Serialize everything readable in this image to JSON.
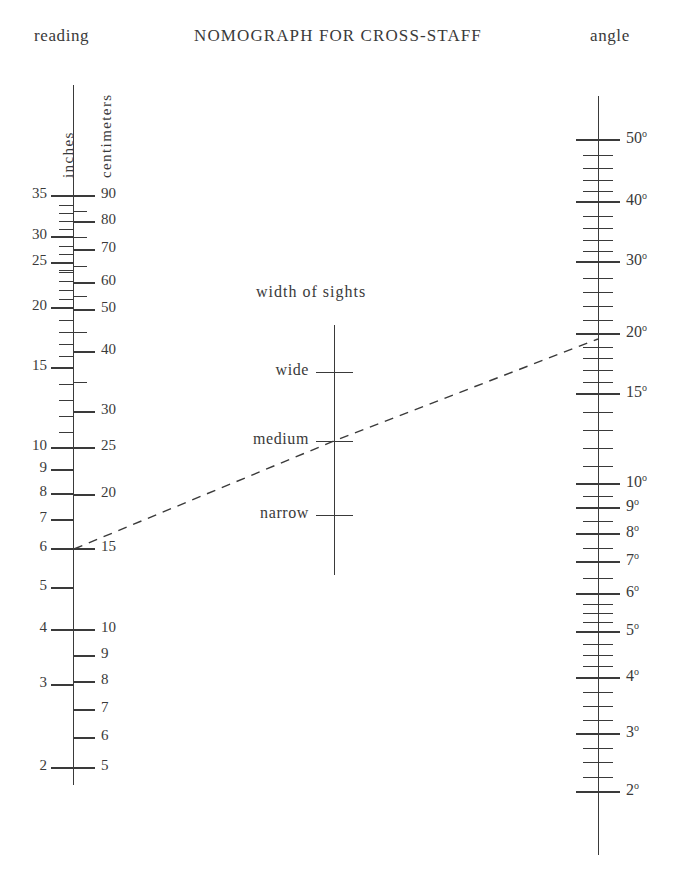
{
  "header": {
    "title": "NOMOGRAPH FOR CROSS-STAFF",
    "left_label": "reading",
    "right_label": "angle"
  },
  "left_scale": {
    "unit_left": "inches",
    "unit_right": "centimeters",
    "inch_labels": [
      "35",
      "30",
      "25",
      "20",
      "15",
      "10",
      "9",
      "8",
      "7",
      "6",
      "5",
      "4",
      "3",
      "2"
    ],
    "cm_labels": [
      "90",
      "80",
      "70",
      "60",
      "50",
      "40",
      "30",
      "25",
      "20",
      "15",
      "10",
      "9",
      "8",
      "7",
      "6",
      "5"
    ]
  },
  "middle_scale": {
    "title": "width of sights",
    "labels": [
      "wide",
      "medium",
      "narrow"
    ]
  },
  "right_scale": {
    "unit": "angle",
    "labels": [
      "50°",
      "40°",
      "30°",
      "20°",
      "15°",
      "10°",
      "9°",
      "8°",
      "7°",
      "6°",
      "5°",
      "4°",
      "3°",
      "2°"
    ]
  },
  "index_line": {
    "style": "dashed",
    "from_reading_inches": "6",
    "from_reading_cm": "15",
    "through_width": "medium",
    "to_angle": "19°"
  },
  "colors": {
    "ink": "#3a3a3a",
    "paper": "#ffffff"
  },
  "chart_data": {
    "type": "line",
    "title": "NOMOGRAPH FOR CROSS-STAFF",
    "subtitle": "",
    "xlabel": "",
    "ylabel": "",
    "grid": false,
    "legend": "none",
    "axes": [
      {
        "name": "reading",
        "position": "left",
        "x_px": 73,
        "y_top_px": 85,
        "y_bottom_px": 785,
        "units": [
          "inches",
          "centimeters"
        ],
        "inch_ticks": [
          {
            "value": 35,
            "y": 196,
            "label": "35"
          },
          {
            "value": 34,
            "y": 205,
            "label": ""
          },
          {
            "value": 33,
            "y": 213,
            "label": ""
          },
          {
            "value": 32,
            "y": 221,
            "label": ""
          },
          {
            "value": 31,
            "y": 229,
            "label": ""
          },
          {
            "value": 30,
            "y": 237,
            "label": "30"
          },
          {
            "value": 29,
            "y": 246,
            "label": ""
          },
          {
            "value": 28,
            "y": 254,
            "label": ""
          },
          {
            "value": 27,
            "y": 262,
            "label": ""
          },
          {
            "value": 26,
            "y": 270,
            "label": ""
          },
          {
            "value": 25,
            "y": 263,
            "label": "25"
          },
          {
            "value": 24,
            "y": 272,
            "label": ""
          },
          {
            "value": 23,
            "y": 281,
            "label": ""
          },
          {
            "value": 22,
            "y": 290,
            "label": ""
          },
          {
            "value": 21,
            "y": 299,
            "label": ""
          },
          {
            "value": 20,
            "y": 308,
            "label": "20"
          },
          {
            "value": 19,
            "y": 320,
            "label": ""
          },
          {
            "value": 18,
            "y": 332,
            "label": ""
          },
          {
            "value": 17,
            "y": 344,
            "label": ""
          },
          {
            "value": 16,
            "y": 356,
            "label": ""
          },
          {
            "value": 15,
            "y": 368,
            "label": "15"
          },
          {
            "value": 14,
            "y": 384,
            "label": ""
          },
          {
            "value": 13,
            "y": 400,
            "label": ""
          },
          {
            "value": 12,
            "y": 416,
            "label": ""
          },
          {
            "value": 11,
            "y": 432,
            "label": ""
          },
          {
            "value": 10,
            "y": 448,
            "label": "10"
          },
          {
            "value": 9,
            "y": 470,
            "label": "9"
          },
          {
            "value": 8,
            "y": 494,
            "label": "8"
          },
          {
            "value": 7,
            "y": 520,
            "label": "7"
          },
          {
            "value": 6,
            "y": 549,
            "label": "6"
          },
          {
            "value": 5,
            "y": 588,
            "label": "5"
          },
          {
            "value": 4,
            "y": 630,
            "label": "4"
          },
          {
            "value": 3,
            "y": 685,
            "label": "3"
          },
          {
            "value": 2,
            "y": 768,
            "label": "2"
          }
        ],
        "cm_ticks": [
          {
            "value": 90,
            "y": 196,
            "label": "90"
          },
          {
            "value": 85,
            "y": 211,
            "label": ""
          },
          {
            "value": 80,
            "y": 222,
            "label": "80"
          },
          {
            "value": 75,
            "y": 237,
            "label": ""
          },
          {
            "value": 70,
            "y": 250,
            "label": "70"
          },
          {
            "value": 65,
            "y": 266,
            "label": ""
          },
          {
            "value": 60,
            "y": 283,
            "label": "60"
          },
          {
            "value": 55,
            "y": 296,
            "label": ""
          },
          {
            "value": 50,
            "y": 310,
            "label": "50"
          },
          {
            "value": 45,
            "y": 332,
            "label": ""
          },
          {
            "value": 40,
            "y": 352,
            "label": "40"
          },
          {
            "value": 35,
            "y": 382,
            "label": ""
          },
          {
            "value": 30,
            "y": 412,
            "label": "30"
          },
          {
            "value": 25,
            "y": 448,
            "label": "25"
          },
          {
            "value": 20,
            "y": 495,
            "label": "20"
          },
          {
            "value": 15,
            "y": 549,
            "label": "15"
          },
          {
            "value": 10,
            "y": 630,
            "label": "10"
          },
          {
            "value": 9,
            "y": 656,
            "label": "9"
          },
          {
            "value": 8,
            "y": 682,
            "label": "8"
          },
          {
            "value": 7,
            "y": 710,
            "label": "7"
          },
          {
            "value": 6,
            "y": 738,
            "label": "6"
          },
          {
            "value": 5,
            "y": 768,
            "label": "5"
          }
        ]
      },
      {
        "name": "width of sights",
        "position": "center",
        "x_px": 334,
        "y_top_px": 325,
        "y_bottom_px": 575,
        "ticks": [
          {
            "label": "wide",
            "y": 372
          },
          {
            "label": "medium",
            "y": 441
          },
          {
            "label": "narrow",
            "y": 515
          }
        ]
      },
      {
        "name": "angle",
        "position": "right",
        "x_px": 598,
        "y_top_px": 96,
        "y_bottom_px": 855,
        "ticks": [
          {
            "value": 50,
            "y": 140,
            "label": "50°"
          },
          {
            "value": 48,
            "y": 155,
            "label": ""
          },
          {
            "value": 46,
            "y": 168,
            "label": ""
          },
          {
            "value": 44,
            "y": 180,
            "label": ""
          },
          {
            "value": 42,
            "y": 191,
            "label": ""
          },
          {
            "value": 40,
            "y": 202,
            "label": "40°"
          },
          {
            "value": 38,
            "y": 216,
            "label": ""
          },
          {
            "value": 36,
            "y": 228,
            "label": ""
          },
          {
            "value": 34,
            "y": 240,
            "label": ""
          },
          {
            "value": 32,
            "y": 251,
            "label": ""
          },
          {
            "value": 30,
            "y": 262,
            "label": "30°"
          },
          {
            "value": 28,
            "y": 278,
            "label": ""
          },
          {
            "value": 26,
            "y": 292,
            "label": ""
          },
          {
            "value": 24,
            "y": 306,
            "label": ""
          },
          {
            "value": 22,
            "y": 320,
            "label": ""
          },
          {
            "value": 20,
            "y": 334,
            "label": "20°"
          },
          {
            "value": 19,
            "y": 347,
            "label": ""
          },
          {
            "value": 18,
            "y": 358,
            "label": ""
          },
          {
            "value": 17,
            "y": 370,
            "label": ""
          },
          {
            "value": 16,
            "y": 382,
            "label": ""
          },
          {
            "value": 15,
            "y": 394,
            "label": "15°"
          },
          {
            "value": 14,
            "y": 412,
            "label": ""
          },
          {
            "value": 13,
            "y": 430,
            "label": ""
          },
          {
            "value": 12,
            "y": 448,
            "label": ""
          },
          {
            "value": 11,
            "y": 466,
            "label": ""
          },
          {
            "value": 10,
            "y": 484,
            "label": "10°"
          },
          {
            "value": 9.5,
            "y": 496,
            "label": ""
          },
          {
            "value": 9,
            "y": 508,
            "label": "9°"
          },
          {
            "value": 8.5,
            "y": 521,
            "label": ""
          },
          {
            "value": 8,
            "y": 534,
            "label": "8°"
          },
          {
            "value": 7.5,
            "y": 548,
            "label": ""
          },
          {
            "value": 7,
            "y": 562,
            "label": "7°"
          },
          {
            "value": 6.5,
            "y": 578,
            "label": ""
          },
          {
            "value": 6,
            "y": 594,
            "label": "6°"
          },
          {
            "value": 5.75,
            "y": 604,
            "label": ""
          },
          {
            "value": 5.5,
            "y": 613,
            "label": ""
          },
          {
            "value": 5.25,
            "y": 622,
            "label": ""
          },
          {
            "value": 5,
            "y": 632,
            "label": "5°"
          },
          {
            "value": 4.75,
            "y": 644,
            "label": ""
          },
          {
            "value": 4.5,
            "y": 655,
            "label": ""
          },
          {
            "value": 4.25,
            "y": 666,
            "label": ""
          },
          {
            "value": 4,
            "y": 678,
            "label": "4°"
          },
          {
            "value": 3.75,
            "y": 692,
            "label": ""
          },
          {
            "value": 3.5,
            "y": 706,
            "label": ""
          },
          {
            "value": 3.25,
            "y": 720,
            "label": ""
          },
          {
            "value": 3,
            "y": 734,
            "label": "3°"
          },
          {
            "value": 2.75,
            "y": 748,
            "label": ""
          },
          {
            "value": 2.5,
            "y": 762,
            "label": ""
          },
          {
            "value": 2.25,
            "y": 777,
            "label": ""
          },
          {
            "value": 2,
            "y": 792,
            "label": "2°"
          }
        ]
      }
    ],
    "index_line": {
      "points": [
        [
          74,
          549
        ],
        [
          334,
          441
        ],
        [
          598,
          339
        ]
      ],
      "dashed": true,
      "reads": "6 in / 15 cm  — medium  — ~19°"
    }
  }
}
